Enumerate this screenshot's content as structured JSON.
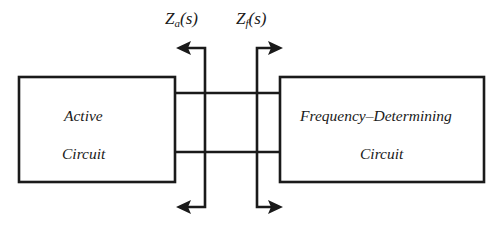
{
  "diagram": {
    "type": "block-diagram",
    "title_visible": false,
    "background_color": "#ffffff",
    "line_color": "#1a1a1a",
    "blocks": [
      {
        "id": "active-circuit",
        "lines": [
          "Active",
          "Circuit"
        ],
        "line1": "Active",
        "line2": "Circuit",
        "x": 19,
        "y": 77,
        "width": 156,
        "height": 105
      },
      {
        "id": "frequency-determining-circuit",
        "lines": [
          "Frequency–Determining",
          "Circuit"
        ],
        "line1": "Frequency–Determining",
        "line2": "Circuit",
        "x": 280,
        "y": 77,
        "width": 204,
        "height": 105
      }
    ],
    "labels": [
      {
        "id": "za",
        "text": "Za(s)",
        "symbol": "Z",
        "subscript": "a",
        "argument": "(s)",
        "x": 165,
        "y": 10,
        "describes": "impedance looking into active circuit"
      },
      {
        "id": "zf",
        "text": "Zf(s)",
        "symbol": "Z",
        "subscript": "f",
        "argument": "(s)",
        "x": 236,
        "y": 10,
        "describes": "impedance looking into frequency-determining circuit"
      }
    ],
    "wires": [
      {
        "id": "top-wire",
        "y": 93,
        "x1": 175,
        "x2": 280
      },
      {
        "id": "bottom-wire",
        "y": 152,
        "x1": 175,
        "x2": 280
      }
    ],
    "arrows": [
      {
        "id": "za-top-arrow",
        "direction": "left",
        "stem_x": 205,
        "elbow_y": 48,
        "tip_x": 176
      },
      {
        "id": "za-bottom-arrow",
        "direction": "left",
        "stem_x": 205,
        "elbow_y": 207,
        "tip_x": 176
      },
      {
        "id": "zf-top-arrow",
        "direction": "right",
        "stem_x": 257,
        "elbow_y": 48,
        "tip_x": 283
      },
      {
        "id": "zf-bottom-arrow",
        "direction": "right",
        "stem_x": 257,
        "elbow_y": 207,
        "tip_x": 283
      }
    ]
  }
}
